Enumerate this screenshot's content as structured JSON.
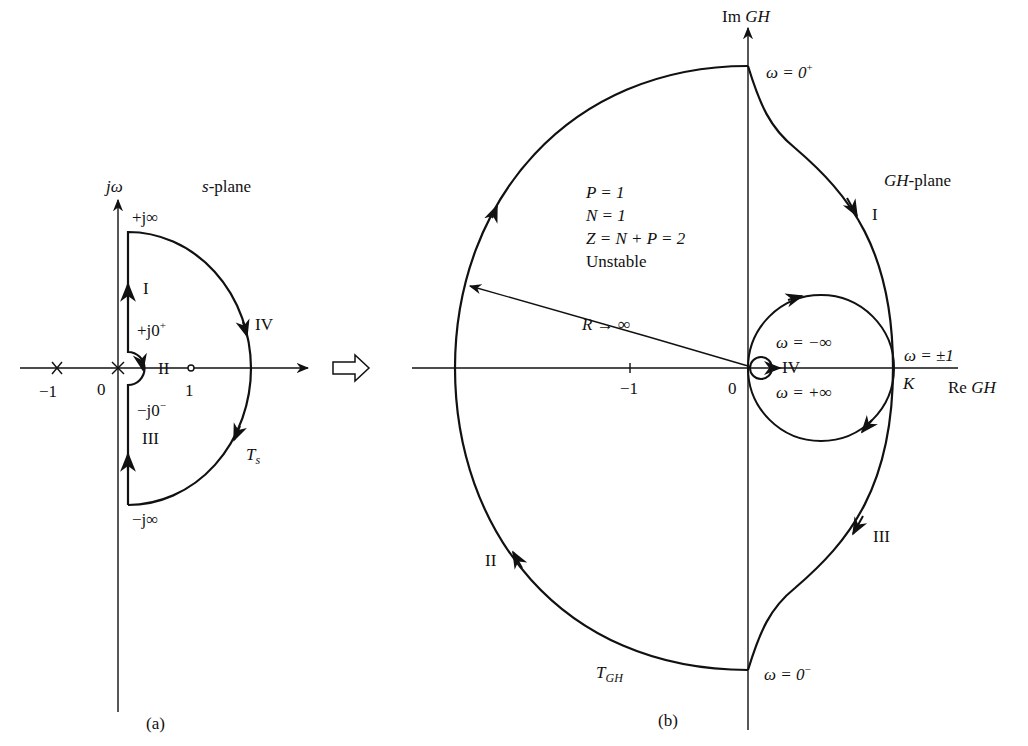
{
  "figure": {
    "colors": {
      "ink": "#111111",
      "background": "#ffffff"
    },
    "panel_a": {
      "caption": "(a)",
      "plane_label_var": "s",
      "plane_label_rest": "-plane",
      "axis_imag": "jω",
      "axis_real_ticks": [
        "−1",
        "0",
        "1"
      ],
      "contour_name": "T",
      "contour_sub": "s",
      "points": {
        "top": "+j∞",
        "near_zero_plus": "+j0",
        "near_zero_plus_sup": "+",
        "near_zero_minus": "−j0",
        "near_zero_minus_sup": "−",
        "bottom": "−j∞"
      },
      "segments": [
        "I",
        "II",
        "III",
        "IV"
      ],
      "poles": [
        "s = 0",
        "s = −1"
      ],
      "zeros": [
        "s = 1"
      ]
    },
    "transform_arrow": "⇨",
    "panel_b": {
      "caption": "(b)",
      "plane_label_var": "GH",
      "plane_label_rest": "-plane",
      "axis_imag_prefix": "Im",
      "axis_imag_var": "GH",
      "axis_real_prefix": "Re",
      "axis_real_var": "GH",
      "axis_real_ticks": [
        "−1",
        "0"
      ],
      "k_label": "K",
      "contour_name": "T",
      "contour_sub": "GH",
      "radius_label": "R → ∞",
      "omega_labels": {
        "top": "ω = 0",
        "top_sup": "+",
        "bottom": "ω = 0",
        "bottom_sup": "−",
        "minus_inf": "ω = −∞",
        "plus_inf": "ω = +∞",
        "pm_one": "ω = ±1"
      },
      "segments": [
        "I",
        "II",
        "III",
        "IV"
      ],
      "analysis": {
        "line1": "P = 1",
        "line2": "N = 1",
        "line3": "Z = N + P = 2",
        "line4": "Unstable"
      }
    }
  }
}
